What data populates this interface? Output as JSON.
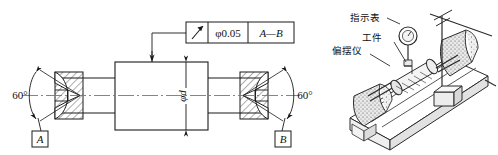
{
  "drawing": {
    "feature_control_frame": {
      "symbol_name": "position-runout-arrow-symbol",
      "tolerance": "φ0.05",
      "datum_reference": "A—B"
    },
    "diameter_dimension": "φd",
    "angles": {
      "left": "60°",
      "right": "60°"
    },
    "datums": {
      "left": "A",
      "right": "B"
    }
  },
  "photo": {
    "labels": {
      "indicator": "指示表",
      "workpiece": "工件",
      "runout_tester": "偏摆仪"
    }
  },
  "colors": {
    "line": "#1a1a1a",
    "thin": "#555555",
    "centerline": "#777777",
    "photo_ink": "#2b2b2b",
    "photo_fill": "#d8d8d8"
  }
}
